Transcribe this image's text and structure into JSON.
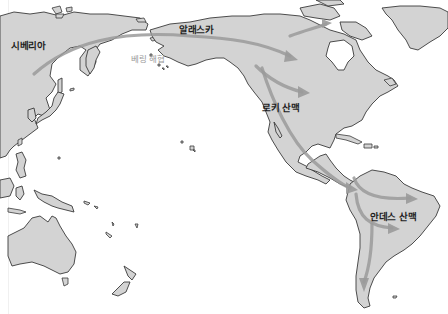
{
  "map": {
    "title": "",
    "labels": {
      "siberia": "시베리아",
      "alaska": "알래스카",
      "bering_strait": "베링 해협",
      "rocky_mountains": "로키 산맥",
      "andes_mountains": "안데스 산맥"
    },
    "colors": {
      "land": "#d3d3d3",
      "coastline": "#3a3a3a",
      "ocean": "#ffffff",
      "migration_route": "#9a9a9a",
      "label_text": "#1e1e1e",
      "sea_label_text": "#9a9a9a"
    },
    "legend": {
      "route_meaning": "migration-route-arrow"
    },
    "routes": [
      {
        "name": "siberia-to-alaska"
      },
      {
        "name": "alaska-to-canada-east"
      },
      {
        "name": "alaska-to-north-america-interior"
      },
      {
        "name": "rockies-to-central-america"
      },
      {
        "name": "south-america-east"
      },
      {
        "name": "south-america-central"
      },
      {
        "name": "south-america-south"
      }
    ]
  }
}
